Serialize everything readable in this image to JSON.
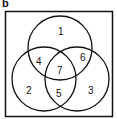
{
  "panel_label": "b",
  "diagram": {
    "type": "venn",
    "sets": 3,
    "regions": [
      {
        "id": "only-top",
        "label": "1"
      },
      {
        "id": "only-left",
        "label": "2"
      },
      {
        "id": "only-right",
        "label": "3"
      },
      {
        "id": "top-left",
        "label": "4"
      },
      {
        "id": "left-right",
        "label": "5"
      },
      {
        "id": "top-right",
        "label": "6"
      },
      {
        "id": "all-three",
        "label": "7"
      }
    ]
  }
}
